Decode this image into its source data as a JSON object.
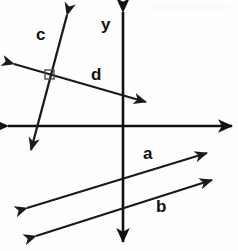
{
  "figure": {
    "kind": "geometry-diagram",
    "background_color": "#fefefe",
    "stroke_color": "#1a1a1a",
    "width": 238,
    "height": 251
  },
  "axes": {
    "y_axis": {
      "label": "y",
      "orientation": "vertical",
      "x": 123,
      "from_y": 12,
      "to_y": 242,
      "arrowheads": "both",
      "label_x": 101,
      "label_y": 16
    },
    "x_axis": {
      "label": "",
      "orientation": "horizontal",
      "y": 126,
      "from_x": 8,
      "to_x": 232,
      "arrowheads": "both"
    }
  },
  "lines": [
    {
      "name": "c",
      "label": "c",
      "x1": 67,
      "y1": 15,
      "x2": 31,
      "y2": 150,
      "arrowheads": "both",
      "label_x": 36,
      "label_y": 26,
      "note": "steep line descending to the left"
    },
    {
      "name": "d",
      "label": "d",
      "x1": 14,
      "y1": 64,
      "x2": 146,
      "y2": 102,
      "arrowheads": "both",
      "label_x": 91,
      "label_y": 66,
      "note": "shallow line descending to the right"
    },
    {
      "name": "a",
      "label": "a",
      "x1": 27,
      "y1": 208,
      "x2": 207,
      "y2": 153,
      "arrowheads": "both",
      "label_x": 143,
      "label_y": 145,
      "note": "upper of two parallel lines rising to the right"
    },
    {
      "name": "b",
      "label": "b",
      "x1": 36,
      "y1": 236,
      "x2": 212,
      "y2": 180,
      "arrowheads": "both",
      "label_x": 156,
      "label_y": 198,
      "note": "lower of two parallel lines rising to the right"
    }
  ],
  "markers": [
    {
      "name": "right-angle-marker",
      "type": "square",
      "x": 49,
      "y": 74,
      "size": 8,
      "between": "c and d",
      "meaning": "perpendicular"
    }
  ]
}
